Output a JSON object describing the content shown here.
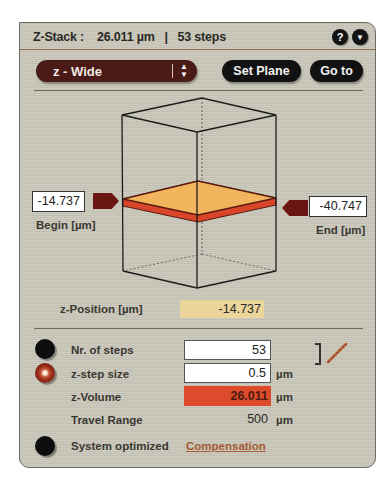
{
  "header": {
    "title": "Z-Stack :    26.011 µm   |   53 steps",
    "help_icon": "?",
    "menu_icon": "▼"
  },
  "toolbar": {
    "mode_select_value": "z - Wide",
    "mode_select_arrows": "▲▼",
    "set_plane_label": "Set Plane",
    "go_to_label": "Go to"
  },
  "stack_view": {
    "begin_value": "-14.737",
    "begin_label": "Begin [µm]",
    "end_value": "-40.747",
    "end_label": "End [µm]",
    "plane_color_top": "#f2b45c",
    "plane_color_edge": "#d8452a",
    "marker_color": "#6a1512"
  },
  "z_position": {
    "label": "z-Position [µm]",
    "value": "-14.737"
  },
  "parameters": {
    "steps_label": "Nr. of steps",
    "steps_value": "53",
    "step_size_label": "z-step size",
    "step_size_value": "0.5",
    "step_size_unit": "µm",
    "volume_label": "z-Volume",
    "volume_value": "26.011",
    "volume_unit": "µm",
    "travel_label": "Travel Range",
    "travel_value": "500",
    "travel_unit": "µm",
    "system_label": "System optimized",
    "compensation_link": "Compensation",
    "link_bracket": "]"
  }
}
